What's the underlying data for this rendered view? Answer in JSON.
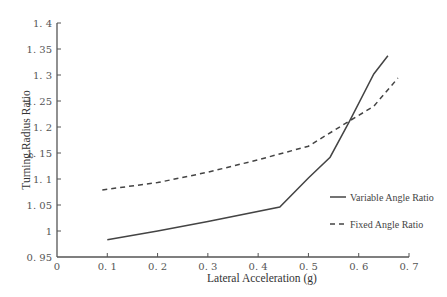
{
  "chart_data": {
    "type": "line",
    "title": "",
    "xlabel": "Lateral Acceleration (g)",
    "ylabel": "Turning Radius Ratio",
    "xlim": [
      0,
      0.7
    ],
    "ylim": [
      0.95,
      1.4
    ],
    "xticks": [
      "0",
      "0.1",
      "0.2",
      "0.3",
      "0.4",
      "0.5",
      "0.6",
      "0.7"
    ],
    "yticks": [
      "0.95",
      "1",
      "1.05",
      "1.1",
      "1.15",
      "1.2",
      "1.25",
      "1.3",
      "1.35",
      "1.4"
    ],
    "grid": false,
    "legend_position": "lower right",
    "series": [
      {
        "name": "Variable Angle Ratio",
        "style": "solid",
        "x": [
          0.1,
          0.2,
          0.3,
          0.443,
          0.5,
          0.543,
          0.582,
          0.63,
          0.658
        ],
        "y": [
          0.983,
          1.0,
          1.018,
          1.046,
          1.102,
          1.142,
          1.212,
          1.302,
          1.337
        ]
      },
      {
        "name": "Fixed Angle Ratio",
        "style": "dashed",
        "x": [
          0.09,
          0.2,
          0.3,
          0.4,
          0.5,
          0.582,
          0.63,
          0.678
        ],
        "y": [
          1.079,
          1.093,
          1.113,
          1.137,
          1.163,
          1.212,
          1.24,
          1.294
        ]
      }
    ]
  },
  "legend": {
    "items": [
      {
        "label": "Variable Angle Ratio"
      },
      {
        "label": "Fixed Angle Ratio"
      }
    ]
  },
  "axes": {
    "xlabel": "Lateral Acceleration (g)",
    "ylabel": "Turning Radius Ratio",
    "xtick_labels": [
      "0",
      "0. 1",
      "0. 2",
      "0. 3",
      "0. 4",
      "0. 5",
      "0. 6",
      "0. 7"
    ],
    "ytick_labels": [
      "0. 95",
      "1",
      "1. 05",
      "1. 1",
      "1. 15",
      "1. 2",
      "1. 25",
      "1. 3",
      "1. 35",
      "1. 4"
    ]
  }
}
